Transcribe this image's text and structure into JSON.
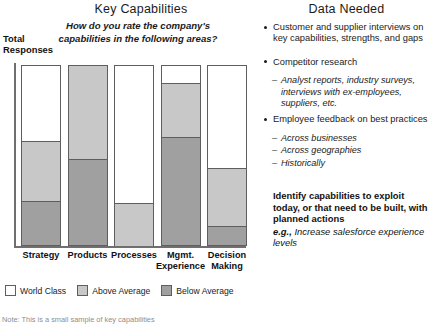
{
  "chart_data": {
    "type": "bar",
    "title": "Key Capabilities",
    "subtitle": "How do you rate the company's capabilities in the following areas?",
    "ylabel": "Total Responses",
    "xlabel": "",
    "stacked": true,
    "normalized_percent": true,
    "ylim": [
      0,
      100
    ],
    "grid": false,
    "legend_position": "bottom-left",
    "categories": [
      "Strategy",
      "Products",
      "Processes",
      "Mgmt. Experience",
      "Decision Making"
    ],
    "series": [
      {
        "name": "World Class",
        "color": "#ffffff",
        "values": [
          42,
          0,
          76,
          10,
          57
        ]
      },
      {
        "name": "Above Average",
        "color": "#c8c8c8",
        "values": [
          33,
          52,
          24,
          30,
          32
        ]
      },
      {
        "name": "Below Average",
        "color": "#a0a0a0",
        "values": [
          25,
          48,
          0,
          60,
          11
        ]
      }
    ],
    "note": "Note: This is a small sample of key capabilities"
  },
  "left": {
    "title": "Key Capabilities",
    "question": "How do you rate the company's capabilities in the following areas?",
    "y_axis_label": "Total Responses",
    "categories": [
      {
        "label": "Strategy"
      },
      {
        "label": "Products"
      },
      {
        "label": "Processes"
      },
      {
        "label": "Mgmt. Experience"
      },
      {
        "label": "Decision Making"
      }
    ],
    "legend": [
      {
        "label": "World Class",
        "color": "#ffffff"
      },
      {
        "label": "Above Average",
        "color": "#c8c8c8"
      },
      {
        "label": "Below Average",
        "color": "#a0a0a0"
      }
    ],
    "note": "Note: This is a small sample of key capabilities"
  },
  "right": {
    "title": "Data Needed",
    "bullets": [
      {
        "text": "Customer and supplier interviews on key capabilities, strengths, and gaps",
        "subitems": []
      },
      {
        "text": "Competitor research",
        "subitems": [
          "Analyst reports, industry surveys, interviews with ex-employees, suppliers, etc."
        ]
      },
      {
        "text": "Employee feedback on best practices",
        "subitems": [
          "Across businesses",
          "Across geographies",
          "Historically"
        ]
      }
    ],
    "conclusion_bold": "Identify capabilities to exploit today, or that need to be built, with planned actions",
    "conclusion_eg_lead": "e.g.,",
    "conclusion_eg_body": "Increase salesforce experience levels"
  }
}
